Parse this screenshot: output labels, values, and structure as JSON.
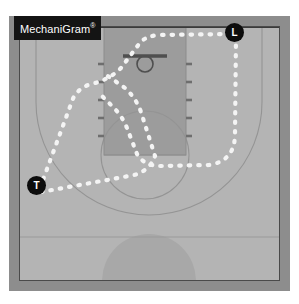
{
  "app": {
    "badge_text": "MechaniGram",
    "badge_mark": "®"
  },
  "colors": {
    "page_background": "#ffffff",
    "frame_border": "#8d8d8d",
    "court_floor": "#b4b4b4",
    "key_paint": "#9a9a9a",
    "court_line": "#8f8f8f",
    "boundary_line": "#3c3c3c",
    "path_dash": "#f2f2f2",
    "token_fill": "#0d0d0d",
    "token_text": "#ffffff",
    "badge_background": "#141414",
    "badge_text_color": "#ffffff",
    "center_circle": "#a6a6a6",
    "backboard": "#4a4a4a"
  },
  "court": {
    "name": "half-court-basketball-diagram",
    "features": [
      "baseline",
      "sideline-left",
      "sideline-right",
      "key-paint",
      "free-throw-line",
      "free-throw-circle",
      "three-point-arc",
      "backboard",
      "hoop",
      "lane-hash-marks",
      "half-court-line",
      "center-circle"
    ]
  },
  "officials": [
    {
      "id": "L",
      "label": "L",
      "role": "lead-official",
      "x": 235,
      "y": 32
    },
    {
      "id": "T",
      "label": "T",
      "role": "trail-official",
      "x": 37,
      "y": 185
    }
  ],
  "movement_paths": [
    {
      "name": "lead-path",
      "from": "L",
      "description": "lead official moves down the right sideline then sweeps left across the baseline side of the key",
      "style": "dashed-white"
    },
    {
      "name": "trail-path",
      "from": "T",
      "description": "trail official moves up through the left wing toward the baseline and back down through the key",
      "style": "dashed-white"
    }
  ]
}
